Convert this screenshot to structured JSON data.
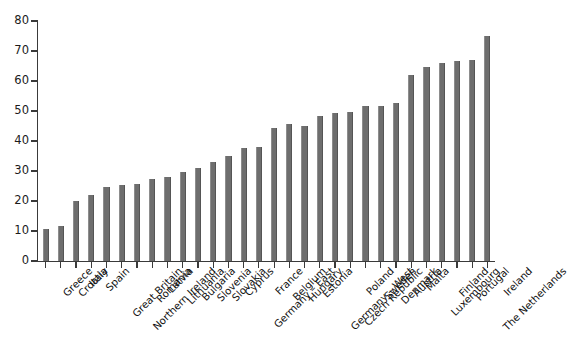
{
  "chart_data": {
    "type": "bar",
    "title": "",
    "subtitle": "",
    "xlabel": "",
    "ylabel": "",
    "ylim": [
      0,
      80
    ],
    "y_ticks": [
      0,
      10,
      20,
      30,
      40,
      50,
      60,
      70,
      80
    ],
    "grid": false,
    "legend": "none",
    "bar_color": "#6e6e6e",
    "axis_color": "#3a3a3a",
    "categories": [
      "Greece",
      "Croatia",
      "Italy",
      "Spain",
      "Great Britain",
      "Northern Ireland",
      "Romania",
      "Latvia",
      "Lithuania",
      "Bulgaria",
      "Slovenia",
      "Slovakia",
      "Cyprus",
      "Germany – East",
      "France",
      "Belgium",
      "Hungary",
      "Estonia",
      "Germany – West",
      "Czech Republic",
      "Poland",
      "Sweden",
      "Denmark",
      "Austria",
      "Malta",
      "Luxembourg",
      "Finland",
      "Portugal",
      "The Netherlands",
      "Ireland"
    ],
    "values": [
      10.7,
      11.6,
      20.0,
      22.1,
      24.7,
      25.4,
      25.6,
      27.4,
      28.0,
      29.8,
      30.9,
      33.0,
      35.1,
      37.6,
      38.1,
      44.3,
      45.6,
      45.1,
      48.5,
      49.5,
      49.8,
      51.6,
      51.8,
      52.7,
      62.1,
      64.6,
      65.9,
      66.7,
      67.0,
      75.0
    ]
  }
}
